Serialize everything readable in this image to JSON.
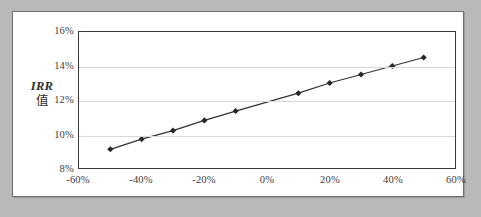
{
  "figure": {
    "background_color": "#b9b9b9",
    "panel_color": "#ffffff",
    "panel_border_color": "#6f6f6f"
  },
  "axis_title": {
    "line1": "IRR",
    "line2": "值"
  },
  "chart_data": {
    "type": "line",
    "title": "",
    "subtitle": "",
    "xlabel": "",
    "ylabel": "IRR 值",
    "xlim": [
      -60,
      60
    ],
    "ylim": [
      8,
      16
    ],
    "xtick_labels": [
      "-60%",
      "-40%",
      "-20%",
      "0%",
      "20%",
      "40%",
      "60%"
    ],
    "xtick_values": [
      -60,
      -40,
      -20,
      0,
      20,
      40,
      60
    ],
    "ytick_labels": [
      "8%",
      "10%",
      "12%",
      "14%",
      "16%"
    ],
    "ytick_values": [
      8,
      10,
      12,
      14,
      16
    ],
    "grid": "horizontal",
    "legend": "none",
    "series": [
      {
        "name": "IRR",
        "marker": "diamond",
        "line_color": "#333333",
        "marker_color": "#262626",
        "x": [
          -50,
          -40,
          -30,
          -20,
          -10,
          10,
          20,
          30,
          40,
          50
        ],
        "values": [
          9.1,
          9.7,
          10.2,
          10.8,
          11.35,
          12.4,
          13.0,
          13.5,
          14.0,
          14.5
        ]
      }
    ]
  }
}
